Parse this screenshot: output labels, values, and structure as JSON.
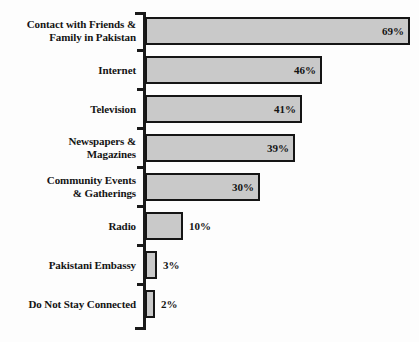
{
  "chart_data": {
    "type": "bar",
    "orientation": "horizontal",
    "title": "",
    "subtitle": "",
    "xlabel": "",
    "ylabel": "",
    "xlim": [
      0,
      69
    ],
    "grid": false,
    "legend": null,
    "value_suffix": "%",
    "categories": [
      "Contact with Friends & Family in Pakistan",
      "Internet",
      "Television",
      "Newspapers & Magazines",
      "Community Events & Gatherings",
      "Radio",
      "Pakistani Embassy",
      "Do Not Stay Connected"
    ],
    "values": [
      69,
      46,
      41,
      39,
      30,
      10,
      3,
      2
    ],
    "data_labels": [
      "69%",
      "46%",
      "41%",
      "39%",
      "30%",
      "10%",
      "3%",
      "2%"
    ],
    "label_placement": [
      "inside",
      "inside",
      "inside",
      "inside",
      "inside",
      "outside",
      "outside",
      "outside"
    ],
    "colors": {
      "bar_fill": "#c9c9c9",
      "bar_border": "#151515",
      "axis": "#1a1a1a",
      "text": "#141414",
      "background": "#fdfdfd"
    }
  },
  "rows": [
    {
      "label_line1": "Contact with Friends &",
      "label_line2": "Family in Pakistan",
      "value_label": "69%"
    },
    {
      "label_line1": "Internet",
      "label_line2": "",
      "value_label": "46%"
    },
    {
      "label_line1": "Television",
      "label_line2": "",
      "value_label": "41%"
    },
    {
      "label_line1": "Newspapers &",
      "label_line2": "Magazines",
      "value_label": "39%"
    },
    {
      "label_line1": "Community Events",
      "label_line2": "& Gatherings",
      "value_label": "30%"
    },
    {
      "label_line1": "Radio",
      "label_line2": "",
      "value_label": "10%"
    },
    {
      "label_line1": "Pakistani Embassy",
      "label_line2": "",
      "value_label": "3%"
    },
    {
      "label_line1": "Do Not Stay Connected",
      "label_line2": "",
      "value_label": "2%"
    }
  ]
}
